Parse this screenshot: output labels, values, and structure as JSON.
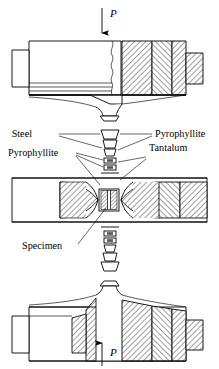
{
  "figure": {
    "type": "engineering-cross-section",
    "labels": {
      "load_top": "P",
      "load_bottom": "P",
      "steel": "Steel",
      "pyrophyllite_right": "Pyrophyllite",
      "pyrophyllite_left": "Pyrophyllite",
      "tantalum": "Tantalum",
      "specimen": "Specimen"
    },
    "colors": {
      "line": "#000000",
      "background": "#ffffff",
      "hatch": "#000000"
    },
    "arrows": {
      "top_direction": "down",
      "bottom_direction": "up"
    }
  }
}
